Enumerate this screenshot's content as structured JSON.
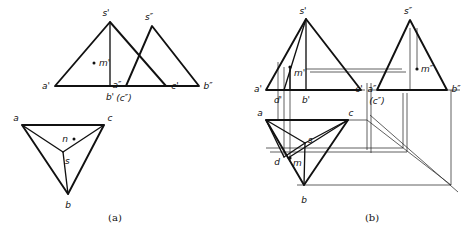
{
  "figure": {
    "captions": {
      "left": "(a)",
      "right": "(b)"
    },
    "colors": {
      "ink": "#111111",
      "thin_line": "#2b2b2b",
      "background": "#ffffff"
    }
  },
  "part_a": {
    "name": "three-view-projection",
    "front_view": {
      "name": "V-projection-front-view",
      "labels": {
        "apex": "s'",
        "left": "a'",
        "right": "c'",
        "bottom": "b'",
        "point_m": "m'"
      }
    },
    "side_view": {
      "name": "W-projection-side-view",
      "labels": {
        "apex": "s″",
        "left": "a″",
        "left_hidden": "(c″)",
        "right": "b″"
      }
    },
    "top_view": {
      "name": "H-projection-top-view",
      "labels": {
        "left": "a",
        "right": "c",
        "bottom": "b",
        "center": "s",
        "point_n": "n"
      }
    }
  },
  "part_b": {
    "name": "axonometric-projection-box",
    "front_view": {
      "name": "V-projection-front-view",
      "labels": {
        "apex": "s'",
        "left": "a'",
        "right": "c'",
        "bottom": "b'",
        "point_d": "d'",
        "point_m": "m'"
      }
    },
    "side_view": {
      "name": "W-projection-side-view",
      "labels": {
        "apex": "s″",
        "left": "a″",
        "left_hidden": "(c″)",
        "right": "b″",
        "point_m": "m″"
      }
    },
    "top_view": {
      "name": "H-projection-top-view",
      "labels": {
        "left": "a",
        "right": "c",
        "bottom": "b",
        "center": "s",
        "point_d": "d",
        "point_m": "m"
      }
    }
  }
}
